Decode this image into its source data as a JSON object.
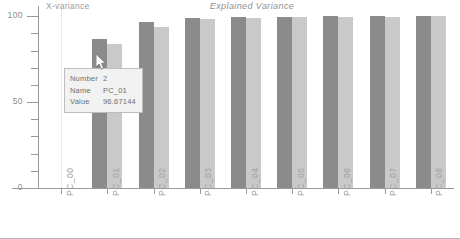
{
  "chart_data": {
    "type": "bar",
    "title": "Explained Variance",
    "xlabel": "PCs",
    "ylabel": "X-variance",
    "categories": [
      "PC_00",
      "PC_01",
      "PC_02",
      "PC_03",
      "PC_04",
      "PC_05",
      "PC_06",
      "PC_07",
      "PC_08"
    ],
    "yticks": [
      0,
      50,
      100
    ],
    "ylim": [
      0,
      106
    ],
    "grid": false,
    "legend": "none",
    "series": [
      {
        "name": "calibration",
        "values": [
          0,
          86.5,
          96.7,
          99.2,
          99.6,
          99.8,
          99.9,
          99.9,
          100.0
        ]
      },
      {
        "name": "validation",
        "values": [
          0,
          84.0,
          94.0,
          98.6,
          99.3,
          99.6,
          99.7,
          99.8,
          99.9
        ]
      }
    ]
  },
  "axis": {
    "y_tick_labels": [
      "100",
      "50",
      "0"
    ],
    "y_label": "X-variance",
    "x_label": "PCs",
    "x_tick_labels": [
      "PC_00",
      "PC_01",
      "PC_02",
      "PC_03",
      "PC_04",
      "PC_05",
      "PC_06",
      "PC_07",
      "PC_08"
    ]
  },
  "title": "Explained Variance",
  "tooltip": {
    "rows": [
      {
        "key": "Number",
        "value": "2"
      },
      {
        "key": "Name",
        "value": "PC_01"
      },
      {
        "key": "Value",
        "value": "96.67144"
      }
    ],
    "number_key": "Number",
    "number_value": "2",
    "name_key": "Name",
    "name_value": "PC_01",
    "value_key": "Value",
    "value_value": "96.67144"
  },
  "colors": {
    "series_0": "#8b8b8b",
    "series_1": "#c9c9c9",
    "axis": "#9a9a9a",
    "text": "#9b9b9b",
    "tooltip_bg": "#f2f2f2",
    "tooltip_border": "#bdbdbd"
  }
}
